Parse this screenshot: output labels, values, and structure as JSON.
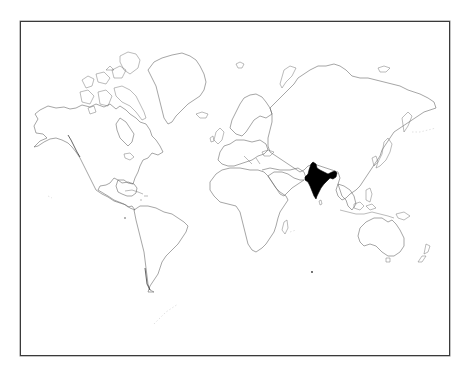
{
  "map": {
    "title": "World map with India highlighted",
    "projection": "Mercator",
    "style": "outline",
    "highlighted_country": "India",
    "highlight_color": "#000000",
    "outline_color": "#6a6a6a",
    "background_color": "#ffffff",
    "frame_color": "#3a3a3a",
    "continents": [
      "North America",
      "Greenland",
      "South America",
      "Europe",
      "Africa",
      "Asia",
      "Australia"
    ]
  }
}
